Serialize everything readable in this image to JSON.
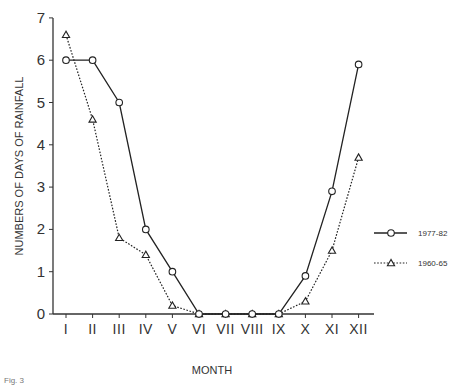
{
  "chart_data": {
    "type": "line",
    "title": "",
    "xlabel": "MONTH",
    "ylabel": "NUMBERS OF DAYS OF RAINFALL",
    "categories": [
      "I",
      "II",
      "III",
      "IV",
      "V",
      "VI",
      "VII",
      "VIII",
      "IX",
      "X",
      "XI",
      "XII"
    ],
    "yticks": [
      0,
      1,
      2,
      3,
      4,
      5,
      6,
      7
    ],
    "ylim": [
      0,
      7
    ],
    "grid": false,
    "legend_position": "right",
    "series": [
      {
        "name": "1977-82",
        "style": "solid",
        "marker": "circle",
        "values": [
          6.0,
          6.0,
          5.0,
          2.0,
          1.0,
          0,
          0,
          0,
          0,
          0.9,
          2.9,
          5.9
        ]
      },
      {
        "name": "1960-65",
        "style": "dotted",
        "marker": "triangle",
        "values": [
          6.6,
          4.6,
          1.8,
          1.4,
          0.2,
          0,
          0,
          0,
          0,
          0.3,
          1.5,
          3.7
        ]
      }
    ]
  },
  "caption": "Fig. 3"
}
